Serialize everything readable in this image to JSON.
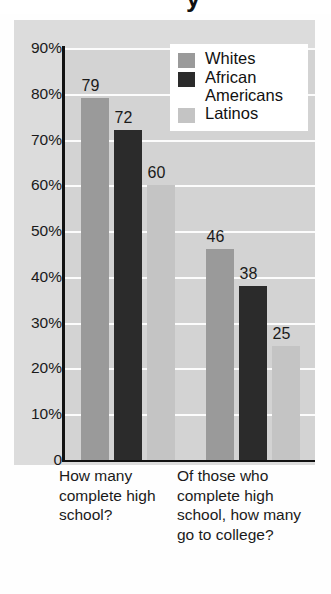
{
  "title_fragment": "y",
  "legend": {
    "position": "top-right",
    "items": [
      {
        "label": "Whites",
        "color": "#9a9a9a",
        "key": "whites"
      },
      {
        "label": "African Americans",
        "color": "#2b2b2b",
        "key": "african-americans"
      },
      {
        "label": "Latinos",
        "color": "#c4c4c4",
        "key": "latinos"
      }
    ]
  },
  "chart_data": {
    "type": "bar",
    "title": "",
    "xlabel": "",
    "ylabel": "",
    "ylim": [
      0,
      90
    ],
    "grid": true,
    "legend_position": "top-right",
    "ytick_labels": [
      "90%",
      "80%",
      "70%",
      "60%",
      "50%",
      "40%",
      "30%",
      "20%",
      "10%",
      "0"
    ],
    "ytick_values": [
      90,
      80,
      70,
      60,
      50,
      40,
      30,
      20,
      10,
      0
    ],
    "categories": [
      "How many complete high school?",
      "Of those who complete high school, how many go to college?"
    ],
    "series": [
      {
        "name": "Whites",
        "color": "#9a9a9a",
        "values": [
          79,
          46
        ]
      },
      {
        "name": "African Americans",
        "color": "#2b2b2b",
        "values": [
          72,
          38
        ]
      },
      {
        "name": "Latinos",
        "color": "#c4c4c4",
        "values": [
          60,
          25
        ]
      }
    ],
    "data_labels": [
      {
        "group": 0,
        "series": "Whites",
        "value": 79,
        "text": "79"
      },
      {
        "group": 0,
        "series": "African Americans",
        "value": 72,
        "text": "72"
      },
      {
        "group": 0,
        "series": "Latinos",
        "value": 60,
        "text": "60"
      },
      {
        "group": 1,
        "series": "Whites",
        "value": 46,
        "text": "46"
      },
      {
        "group": 1,
        "series": "African Americans",
        "value": 38,
        "text": "38"
      },
      {
        "group": 1,
        "series": "Latinos",
        "value": 25,
        "text": "25"
      }
    ]
  },
  "colors": {
    "panel_bg": "#dcdcdc",
    "plot_bg": "#d3d3d3",
    "gridline": "#fcfcfc",
    "axis": "#111111",
    "legend_bg": "#ffffff",
    "text": "#1a1a1a"
  }
}
